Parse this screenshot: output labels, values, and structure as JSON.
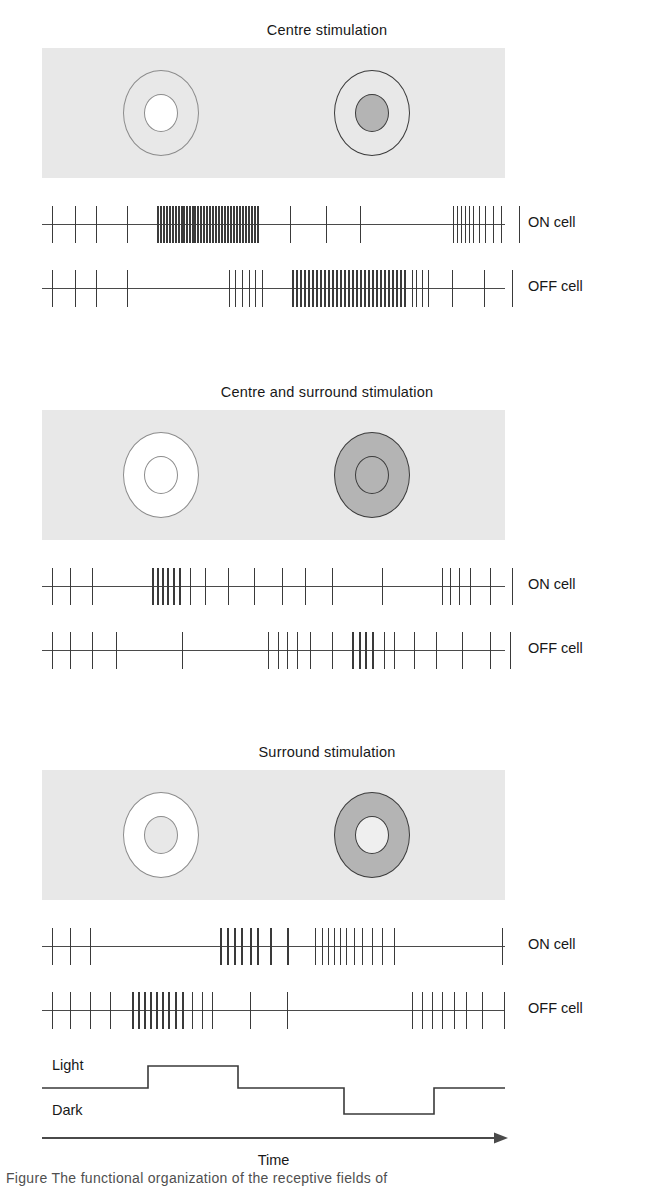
{
  "figure": {
    "caption_partial": "Figure      The functional organization of the receptive fields of",
    "time_axis_label": "Time",
    "stimulus_levels": {
      "light_label": "Light",
      "dark_label": "Dark"
    },
    "colors": {
      "field_background": "#e8e8e8",
      "light_fill": "#ffffff",
      "grey_fill": "#b4b4b4",
      "outline_light": "#8c8c8c",
      "outline_dark": "#3c3c3c",
      "spike": "#3a3a3a",
      "axis": "#4a4a4a"
    }
  },
  "panels": [
    {
      "title": "Centre stimulation",
      "field": {
        "left_rf": {
          "name": "on-centre-receptive-field",
          "surround_fill": "none",
          "surround_outline": "#8c8c8c",
          "centre_fill": "#ffffff",
          "centre_outline": "#8c8c8c"
        },
        "right_rf": {
          "name": "off-centre-receptive-field",
          "surround_fill": "none",
          "surround_outline": "#3c3c3c",
          "centre_fill": "#b4b4b4",
          "centre_outline": "#3c3c3c"
        }
      },
      "rows": [
        {
          "label": "ON cell",
          "cell": "ON",
          "spikes": [
            10,
            33,
            54,
            85,
            115,
            118,
            121,
            124,
            127,
            130,
            133,
            136,
            139,
            141,
            144,
            147,
            150,
            152,
            155,
            158,
            161,
            164,
            167,
            170,
            173,
            176,
            179,
            182,
            185,
            188,
            191,
            194,
            197,
            200,
            203,
            206,
            209,
            212,
            215,
            248,
            284,
            318,
            411,
            415,
            419,
            423,
            427,
            431,
            437,
            443,
            451,
            459,
            477
          ],
          "burst_range": [
            113,
            218
          ],
          "firing": "high during light onset"
        },
        {
          "label": "OFF cell",
          "cell": "OFF",
          "spikes": [
            10,
            33,
            54,
            85,
            187,
            193,
            200,
            207,
            213,
            220,
            250,
            254,
            258,
            262,
            266,
            270,
            274,
            278,
            282,
            286,
            290,
            294,
            298,
            302,
            306,
            310,
            314,
            318,
            322,
            326,
            330,
            334,
            338,
            342,
            346,
            350,
            354,
            358,
            362,
            370,
            374,
            380,
            386,
            410,
            442,
            470
          ],
          "burst_range": [
            248,
            366
          ],
          "firing": "high during dark phase"
        }
      ]
    },
    {
      "title": "Centre and surround stimulation",
      "field": {
        "left_rf": {
          "name": "on-centre-receptive-field",
          "surround_fill": "#ffffff",
          "surround_outline": "#8c8c8c",
          "centre_fill": "#ffffff",
          "centre_outline": "#8c8c8c"
        },
        "right_rf": {
          "name": "off-centre-receptive-field",
          "surround_fill": "#b4b4b4",
          "surround_outline": "#3c3c3c",
          "centre_fill": "#b4b4b4",
          "centre_outline": "#3c3c3c"
        }
      },
      "rows": [
        {
          "label": "ON cell",
          "cell": "ON",
          "spikes": [
            10,
            28,
            50,
            110,
            115,
            120,
            125,
            131,
            137,
            148,
            163,
            186,
            212,
            240,
            263,
            290,
            340,
            400,
            408,
            417,
            428,
            448,
            470
          ],
          "burst_range": [
            108,
            139
          ],
          "firing": "modest"
        },
        {
          "label": "OFF cell",
          "cell": "OFF",
          "spikes": [
            10,
            28,
            50,
            74,
            140,
            226,
            236,
            245,
            255,
            268,
            290,
            310,
            317,
            323,
            330,
            342,
            352,
            372,
            394,
            420,
            448,
            468
          ],
          "burst_range": [
            305,
            335
          ],
          "firing": "modest"
        }
      ]
    },
    {
      "title": "Surround stimulation",
      "field": {
        "left_rf": {
          "name": "on-centre-receptive-field",
          "surround_fill": "#ffffff",
          "surround_outline": "#8c8c8c",
          "centre_fill": "#e8e8e8",
          "centre_outline": "#8c8c8c"
        },
        "right_rf": {
          "name": "off-centre-receptive-field",
          "surround_fill": "#b4b4b4",
          "surround_outline": "#3c3c3c",
          "centre_fill": "#efefef",
          "centre_outline": "#3c3c3c"
        }
      },
      "rows": [
        {
          "label": "ON cell",
          "cell": "ON",
          "spikes": [
            10,
            28,
            48,
            178,
            185,
            192,
            199,
            208,
            215,
            228,
            245,
            273,
            280,
            286,
            292,
            298,
            304,
            312,
            320,
            330,
            340,
            352,
            460
          ],
          "burst_range": [
            176,
            246
          ],
          "firing": "high during surround light"
        },
        {
          "label": "OFF cell",
          "cell": "OFF",
          "spikes": [
            10,
            28,
            48,
            68,
            90,
            96,
            102,
            108,
            114,
            120,
            126,
            133,
            140,
            150,
            160,
            170,
            208,
            245,
            370,
            380,
            390,
            400,
            412,
            424,
            440,
            462
          ],
          "burst_range": [
            88,
            148
          ],
          "firing": "high early"
        }
      ]
    }
  ],
  "stimulus_trace": {
    "baseline_y": 34,
    "light_y": 12,
    "dark_y": 60,
    "segments": [
      {
        "state": "baseline",
        "x0": 0,
        "x1": 106
      },
      {
        "state": "light",
        "x0": 106,
        "x1": 196
      },
      {
        "state": "baseline",
        "x0": 196,
        "x1": 302
      },
      {
        "state": "dark",
        "x0": 302,
        "x1": 392
      },
      {
        "state": "baseline",
        "x0": 392,
        "x1": 463
      }
    ]
  }
}
